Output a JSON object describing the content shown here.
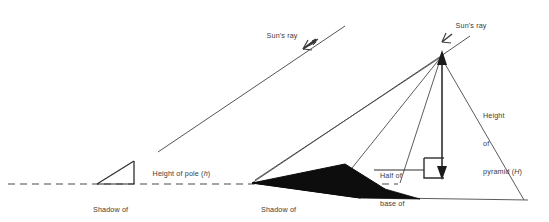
{
  "diagram": {
    "title_text": "",
    "stroke_color": "#4a4a4a",
    "fill_color": "#101010",
    "text_color": "#3a3a3a",
    "ground_line_style": "dashed",
    "labels": {
      "sun_ray_left": "Sun's ray",
      "sun_ray_right": "Sun's ray",
      "height_of_pole_text": "Height of pole (",
      "height_of_pole_symbol": "h",
      "height_of_pole_close": ")",
      "shadow_of_pole_line1": "Shadow of",
      "shadow_of_pole_line2_text": "pole (",
      "shadow_of_pole_symbol": "L",
      "shadow_of_pole_close": ")",
      "shadow_of_pyramid_line1": "Shadow of",
      "shadow_of_pyramid_line2_text": "pyramid (",
      "shadow_of_pyramid_symbol": "m",
      "shadow_of_pyramid_close": ")",
      "half_base_line1": "Half of",
      "half_base_line2": "base of",
      "half_base_line3_text": "pyramid (",
      "half_base_symbol": "b",
      "half_base_close": ")",
      "height_pyramid_line1": "Height",
      "height_pyramid_line2": "of",
      "height_pyramid_line3_text": "pyramid (",
      "height_pyramid_symbol": "H",
      "height_pyramid_close": ")"
    },
    "icons": {
      "arrow_left_ray": "arrowhead-down-left",
      "arrow_right_ray": "arrowhead-down-left",
      "arrow_apex": "arrowhead-up",
      "arrow_height": "arrowhead-down",
      "right_angle": "right-angle-marker"
    }
  }
}
